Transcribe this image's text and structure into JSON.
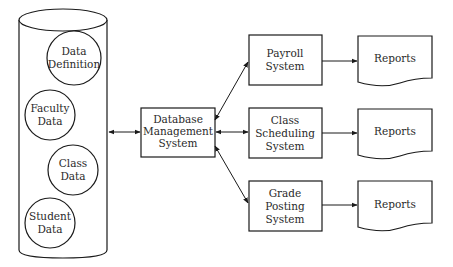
{
  "diagram": {
    "type": "data-flow",
    "database": {
      "shape": "cylinder",
      "contents": [
        {
          "id": "data-definition",
          "lines": [
            "Data",
            "Definition"
          ]
        },
        {
          "id": "faculty-data",
          "lines": [
            "Faculty",
            "Data"
          ]
        },
        {
          "id": "class-data",
          "lines": [
            "Class",
            "Data"
          ]
        },
        {
          "id": "student-data",
          "lines": [
            "Student",
            "Data"
          ]
        }
      ]
    },
    "dbms": {
      "lines": [
        "Database",
        "Management",
        "System"
      ]
    },
    "systems": [
      {
        "id": "payroll",
        "lines": [
          "Payroll",
          "System"
        ],
        "output": "Reports"
      },
      {
        "id": "class-scheduling",
        "lines": [
          "Class",
          "Scheduling",
          "System"
        ],
        "output": "Reports"
      },
      {
        "id": "grade-posting",
        "lines": [
          "Grade",
          "Posting",
          "System"
        ],
        "output": "Reports"
      }
    ],
    "connections": [
      {
        "from": "database",
        "to": "dbms",
        "bidirectional": true
      },
      {
        "from": "dbms",
        "to": "payroll",
        "bidirectional": true
      },
      {
        "from": "dbms",
        "to": "class-scheduling",
        "bidirectional": true
      },
      {
        "from": "dbms",
        "to": "grade-posting",
        "bidirectional": true
      },
      {
        "from": "payroll",
        "to": "reports-1"
      },
      {
        "from": "class-scheduling",
        "to": "reports-2"
      },
      {
        "from": "grade-posting",
        "to": "reports-3"
      }
    ],
    "colors": {
      "stroke": "#1a1a1a",
      "text": "#2a2a2a",
      "background": "#ffffff"
    }
  }
}
